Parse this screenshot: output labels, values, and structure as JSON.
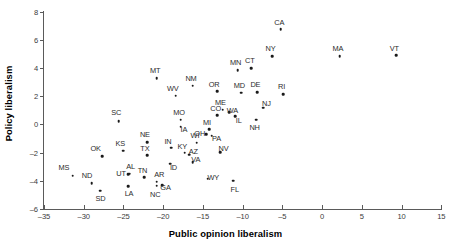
{
  "chart_data": {
    "type": "scatter",
    "title": "",
    "xlabel": "Public opinion liberalism",
    "ylabel": "Policy liberalism",
    "xlim": [
      -35,
      15
    ],
    "ylim": [
      -6,
      8
    ],
    "xticks": [
      -35,
      -30,
      -25,
      -20,
      -15,
      -10,
      -5,
      0,
      5,
      10,
      15
    ],
    "yticks": [
      -6,
      -4,
      -2,
      0,
      2,
      4,
      6,
      8
    ],
    "grid": false,
    "legend": null,
    "point_color": "#1a1a1a",
    "axis_color": "#5a5a5a",
    "points": [
      {
        "label": "MS",
        "x": -31.4,
        "y": -3.65,
        "lx": -32.5,
        "ly": -3.05
      },
      {
        "label": "ND",
        "x": -29.0,
        "y": -4.15,
        "lx": -29.6,
        "ly": -3.6
      },
      {
        "label": "SD",
        "x": -27.9,
        "y": -4.7,
        "lx": -27.9,
        "ly": -5.25
      },
      {
        "label": "OK",
        "x": -27.7,
        "y": -2.25,
        "lx": -28.5,
        "ly": -1.7
      },
      {
        "label": "SC",
        "x": -25.6,
        "y": 0.25,
        "lx": -25.9,
        "ly": 0.85
      },
      {
        "label": "KS",
        "x": -25.0,
        "y": -1.85,
        "lx": -25.4,
        "ly": -1.3
      },
      {
        "label": "UT",
        "x": -24.4,
        "y": -3.55,
        "lx": -25.3,
        "ly": -3.45
      },
      {
        "label": "AL",
        "x": -24.2,
        "y": -3.5,
        "lx": -24.1,
        "ly": -2.95
      },
      {
        "label": "LA",
        "x": -24.4,
        "y": -4.4,
        "lx": -24.3,
        "ly": -4.9
      },
      {
        "label": "NE",
        "x": -22.0,
        "y": -1.25,
        "lx": -22.3,
        "ly": -0.7
      },
      {
        "label": "TX",
        "x": -22.0,
        "y": -2.2,
        "lx": -22.3,
        "ly": -1.68
      },
      {
        "label": "TN",
        "x": -22.4,
        "y": -3.75,
        "lx": -22.6,
        "ly": -3.25
      },
      {
        "label": "MT",
        "x": -20.8,
        "y": 3.3,
        "lx": -21.0,
        "ly": 3.85
      },
      {
        "label": "AR",
        "x": -20.8,
        "y": -4.05,
        "lx": -20.5,
        "ly": -3.55
      },
      {
        "label": "NC",
        "x": -20.8,
        "y": -4.35,
        "lx": -21.0,
        "ly": -4.95
      },
      {
        "label": "GA",
        "x": -20.1,
        "y": -4.3,
        "lx": -19.7,
        "ly": -4.45
      },
      {
        "label": "WV",
        "x": -18.4,
        "y": 2.05,
        "lx": -18.8,
        "ly": 2.6
      },
      {
        "label": "IN",
        "x": -19.0,
        "y": -1.65,
        "lx": -19.4,
        "ly": -1.15
      },
      {
        "label": "ID",
        "x": -19.1,
        "y": -2.8,
        "lx": -18.7,
        "ly": -3.05
      },
      {
        "label": "MO",
        "x": -17.8,
        "y": 0.35,
        "lx": -18.0,
        "ly": 0.9
      },
      {
        "label": "IA",
        "x": -17.8,
        "y": -0.15,
        "lx": -17.4,
        "ly": -0.3
      },
      {
        "label": "NM",
        "x": -16.3,
        "y": 2.75,
        "lx": -16.5,
        "ly": 3.3
      },
      {
        "label": "KY",
        "x": -17.3,
        "y": -2.0,
        "lx": -17.6,
        "ly": -1.5
      },
      {
        "label": "AZ",
        "x": -16.7,
        "y": -2.15,
        "lx": -16.2,
        "ly": -1.85
      },
      {
        "label": "VA",
        "x": -16.3,
        "y": -2.7,
        "lx": -15.9,
        "ly": -2.45
      },
      {
        "label": "WI",
        "x": -15.8,
        "y": -1.3,
        "lx": -16.0,
        "ly": -0.75
      },
      {
        "label": "WY",
        "x": -14.4,
        "y": -3.85,
        "lx": -13.7,
        "ly": -3.7
      },
      {
        "label": "OH",
        "x": -14.6,
        "y": -0.7,
        "lx": -15.4,
        "ly": -0.62
      },
      {
        "label": "MI",
        "x": -14.2,
        "y": -0.35,
        "lx": -14.5,
        "ly": 0.2
      },
      {
        "label": "PA",
        "x": -13.9,
        "y": -0.8,
        "lx": -13.3,
        "ly": -0.95
      },
      {
        "label": "OR",
        "x": -13.2,
        "y": 2.35,
        "lx": -13.6,
        "ly": 2.9
      },
      {
        "label": "NV",
        "x": -12.8,
        "y": -1.95,
        "lx": -12.4,
        "ly": -1.7
      },
      {
        "label": "CO",
        "x": -13.2,
        "y": 0.65,
        "lx": -13.4,
        "ly": 1.15
      },
      {
        "label": "ME",
        "x": -12.5,
        "y": 1.05,
        "lx": -12.8,
        "ly": 1.6
      },
      {
        "label": "WA",
        "x": -11.7,
        "y": 0.85,
        "lx": -11.3,
        "ly": 1.05
      },
      {
        "label": "IL",
        "x": -10.9,
        "y": 0.6,
        "lx": -10.5,
        "ly": 0.35
      },
      {
        "label": "MN",
        "x": -10.6,
        "y": 3.85,
        "lx": -10.9,
        "ly": 4.4
      },
      {
        "label": "MD",
        "x": -10.2,
        "y": 2.25,
        "lx": -10.4,
        "ly": 2.8
      },
      {
        "label": "CT",
        "x": -8.9,
        "y": 4.0,
        "lx": -9.1,
        "ly": 4.55
      },
      {
        "label": "DE",
        "x": -8.2,
        "y": 2.3,
        "lx": -8.4,
        "ly": 2.85
      },
      {
        "label": "NH",
        "x": -8.3,
        "y": 0.35,
        "lx": -8.5,
        "ly": -0.2
      },
      {
        "label": "NJ",
        "x": -7.4,
        "y": 1.2,
        "lx": -7.0,
        "ly": 1.5
      },
      {
        "label": "FL",
        "x": -11.2,
        "y": -4.0,
        "lx": -11.0,
        "ly": -4.55
      },
      {
        "label": "CA",
        "x": -5.2,
        "y": 6.75,
        "lx": -5.4,
        "ly": 7.3
      },
      {
        "label": "NY",
        "x": -6.3,
        "y": 4.85,
        "lx": -6.5,
        "ly": 5.4
      },
      {
        "label": "RI",
        "x": -4.9,
        "y": 2.15,
        "lx": -5.1,
        "ly": 2.7
      },
      {
        "label": "MA",
        "x": 2.2,
        "y": 4.85,
        "lx": 2.0,
        "ly": 5.4
      },
      {
        "label": "VT",
        "x": 9.3,
        "y": 4.9,
        "lx": 9.1,
        "ly": 5.45
      }
    ]
  }
}
